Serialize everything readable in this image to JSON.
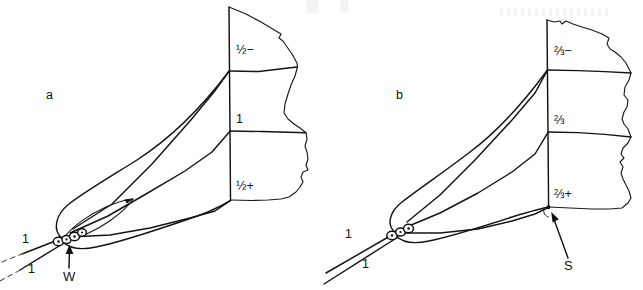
{
  "figure": {
    "kind": "line-diagram",
    "background_color": "#ffffff",
    "line_color": "#111111",
    "panels": [
      {
        "id": "a",
        "panel_label": "a",
        "face_labels": [
          {
            "id": "a-top",
            "text": "½−"
          },
          {
            "id": "a-mid",
            "text": "1"
          },
          {
            "id": "a-bot",
            "text": "½+"
          }
        ],
        "line_labels": [
          {
            "id": "a-line-upper",
            "text": "1"
          },
          {
            "id": "a-line-lower",
            "text": "1"
          }
        ],
        "callouts": [
          {
            "id": "a-callout-w",
            "text": "W",
            "points_to": "node-cluster"
          }
        ]
      },
      {
        "id": "b",
        "panel_label": "b",
        "face_labels": [
          {
            "id": "b-top",
            "text": "⅔−"
          },
          {
            "id": "b-mid",
            "text": "⅔"
          },
          {
            "id": "b-bot",
            "text": "⅔+"
          }
        ],
        "line_labels": [
          {
            "id": "b-line-upper",
            "text": "1"
          },
          {
            "id": "b-line-lower",
            "text": "1"
          }
        ],
        "callouts": [
          {
            "id": "b-callout-s",
            "text": "S",
            "points_to": "lower-front-corner"
          }
        ]
      }
    ]
  }
}
